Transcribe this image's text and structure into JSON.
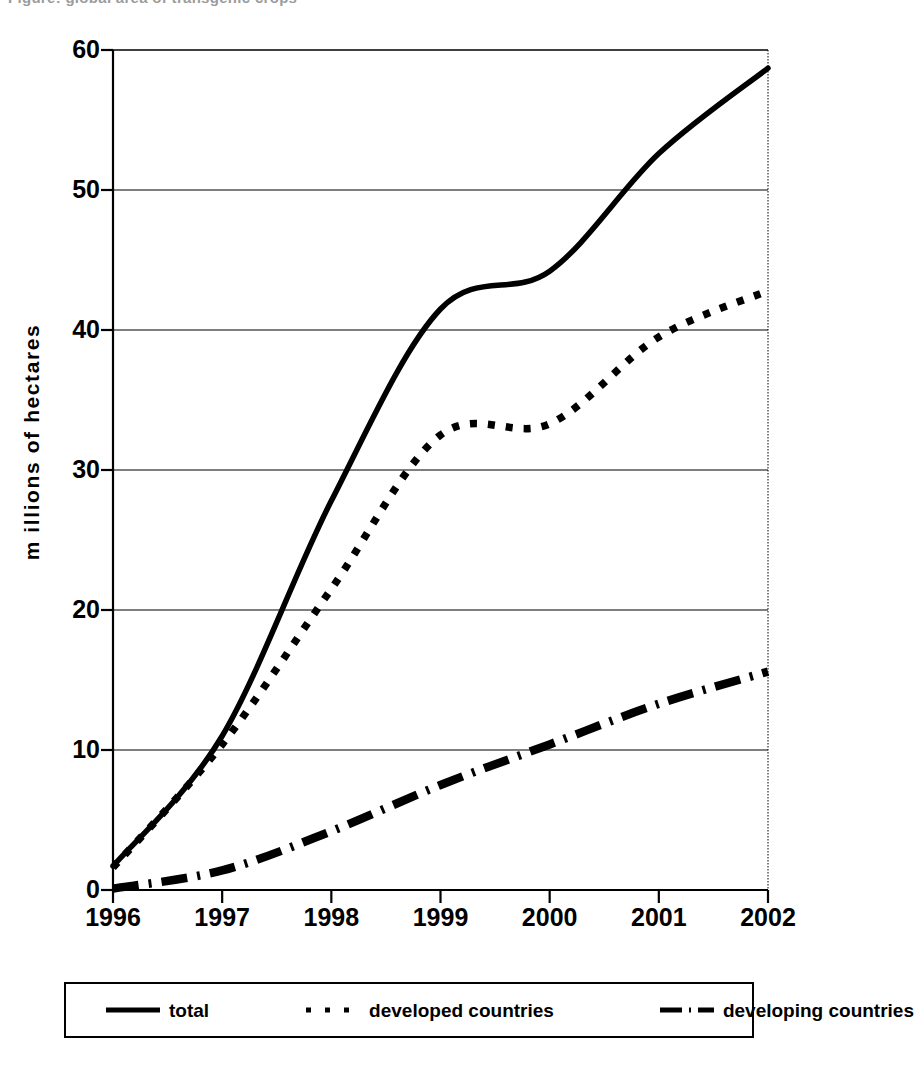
{
  "figure": {
    "cut_title": "Figure: global area of transgenic crops",
    "y_axis_title": "m illions of hectares"
  },
  "axes": {
    "y_ticks": [
      "0",
      "10",
      "20",
      "30",
      "40",
      "50",
      "60"
    ],
    "x_ticks": [
      "1996",
      "1997",
      "1998",
      "1999",
      "2000",
      "2001",
      "2002"
    ]
  },
  "legend": {
    "entries": [
      {
        "label": "total",
        "style": "solid",
        "color": "#000000"
      },
      {
        "label": "developed countries",
        "style": "dotted",
        "color": "#000000"
      },
      {
        "label": "developing countries",
        "style": "dash-dot",
        "color": "#000000"
      }
    ]
  },
  "chart_data": {
    "type": "line",
    "title": "",
    "xlabel": "",
    "ylabel": "millions of hectares",
    "x": [
      1996,
      1997,
      1998,
      1999,
      2000,
      2001,
      2002
    ],
    "xlim": [
      1996,
      2002
    ],
    "ylim": [
      0,
      60
    ],
    "yticks": [
      0,
      10,
      20,
      30,
      40,
      50,
      60
    ],
    "xticks": [
      1996,
      1997,
      1998,
      1999,
      2000,
      2001,
      2002
    ],
    "grid": "horizontal",
    "legend_position": "below-plot",
    "series": [
      {
        "name": "total",
        "style": "solid",
        "color": "#000000",
        "values": [
          1.7,
          11.0,
          27.8,
          41.5,
          44.2,
          52.6,
          58.7
        ]
      },
      {
        "name": "developed countries",
        "style": "dotted",
        "color": "#000000",
        "values": [
          1.6,
          10.4,
          21.5,
          32.5,
          33.3,
          39.5,
          42.8
        ]
      },
      {
        "name": "developing countries",
        "style": "dash-dot",
        "color": "#000000",
        "values": [
          0.1,
          1.4,
          4.2,
          7.5,
          10.4,
          13.3,
          15.6
        ]
      }
    ]
  }
}
